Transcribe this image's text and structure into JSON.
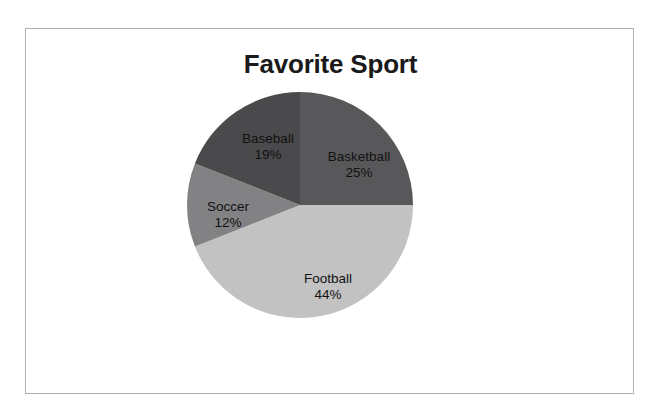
{
  "chart": {
    "title": "Favorite Sport",
    "frame_border_color": "#b0b0b0",
    "background_color": "#ffffff",
    "label_text_color": "#111111"
  },
  "chart_data": {
    "type": "pie",
    "title": "Favorite Sport",
    "categories": [
      "Basketball",
      "Football",
      "Soccer",
      "Baseball"
    ],
    "values": [
      25,
      44,
      12,
      19
    ],
    "unit": "%",
    "start_angle_deg": 0,
    "direction": "clockwise",
    "legend": "none",
    "grid": false,
    "slices": [
      {
        "label": "Basketball",
        "value": 25,
        "value_text": "25%",
        "color": "#58585a"
      },
      {
        "label": "Football",
        "value": 44,
        "value_text": "44%",
        "color": "#c2c2c2"
      },
      {
        "label": "Soccer",
        "value": 12,
        "value_text": "12%",
        "color": "#828284"
      },
      {
        "label": "Baseball",
        "value": 19,
        "value_text": "19%",
        "color": "#4a4a4c"
      }
    ]
  }
}
